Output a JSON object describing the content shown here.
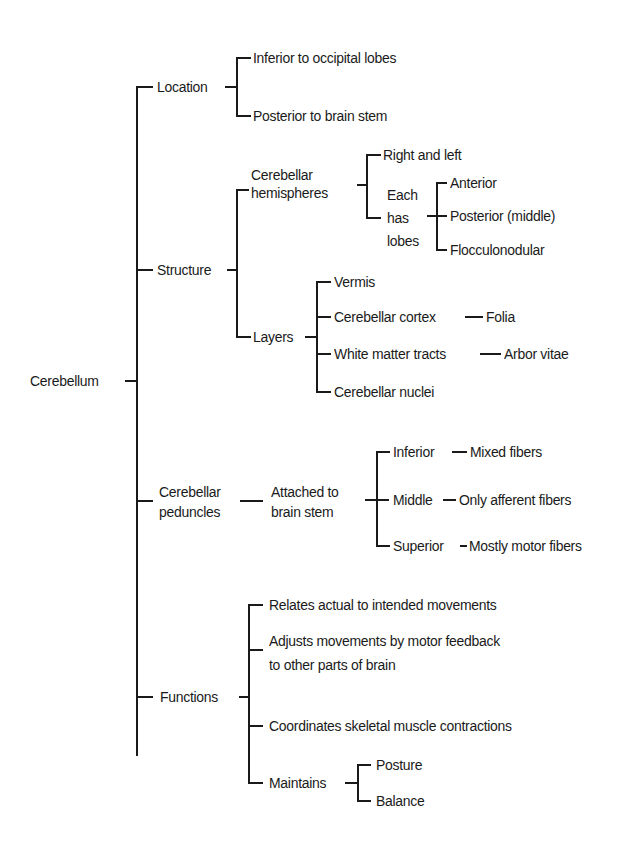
{
  "root": "Cerebellum",
  "location": {
    "label": "Location",
    "items": [
      "Inferior to occipital lobes",
      "Posterior to brain stem"
    ]
  },
  "structure": {
    "label": "Structure",
    "hemispheres": {
      "label": "Cerebellar\nhemispheres",
      "right_left": "Right and left",
      "lobes_label": "Each\nhas\nlobes",
      "lobes": [
        "Anterior",
        "Posterior (middle)",
        "Flocculonodular"
      ]
    },
    "layers": {
      "label": "Layers",
      "items": [
        "Vermis",
        "Cerebellar cortex",
        "White matter tracts",
        "Cerebellar nuclei"
      ],
      "cortex_sub": "Folia",
      "white_sub": "Arbor vitae"
    }
  },
  "peduncles": {
    "label": "Cerebellar\npeduncles",
    "attached": "Attached to\nbrain stem",
    "items": [
      {
        "name": "Inferior",
        "desc": "Mixed fibers"
      },
      {
        "name": "Middle",
        "desc": "Only afferent fibers"
      },
      {
        "name": "Superior",
        "desc": "Mostly motor fibers"
      }
    ]
  },
  "functions": {
    "label": "Functions",
    "items": [
      "Relates actual to intended movements",
      "Adjusts movements by motor feedback\nto other parts of brain",
      "Coordinates skeletal muscle contractions"
    ],
    "maintains": {
      "label": "Maintains",
      "items": [
        "Posture",
        "Balance"
      ]
    }
  }
}
